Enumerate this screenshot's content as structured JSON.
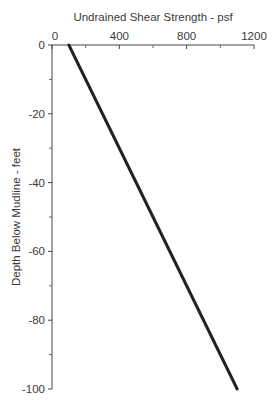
{
  "chart_data": {
    "type": "line",
    "title": "",
    "xlabel": "Undrained Shear Strength - psf",
    "ylabel": "Depth Below Mudline -  feet",
    "x_axis_position": "top",
    "xlim": [
      0,
      1200
    ],
    "ylim": [
      -100,
      0
    ],
    "x_ticks": [
      0,
      400,
      800,
      1200
    ],
    "x_tick_labels": [
      "0",
      "400",
      "800",
      "1200"
    ],
    "x_minor_ticks": [
      200,
      600,
      1000
    ],
    "y_ticks": [
      0,
      -20,
      -40,
      -60,
      -80,
      -100
    ],
    "y_tick_labels": [
      "0",
      "-20",
      "-40",
      "-60",
      "-80",
      "-100"
    ],
    "y_minor_ticks": [
      -10,
      -30,
      -50,
      -70,
      -90
    ],
    "grid": false,
    "legend": null,
    "series": [
      {
        "name": "Undrained shear strength profile",
        "x": [
          100,
          1100
        ],
        "y": [
          0,
          -100
        ],
        "color": "#222222"
      }
    ]
  }
}
